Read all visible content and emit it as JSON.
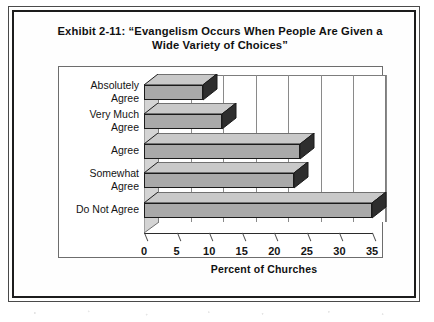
{
  "chart_data": {
    "type": "bar",
    "orientation": "horizontal",
    "title_line1": "Exhibit 2-11: “Evangelism Occurs When People Are Given a",
    "title_line2": "Wide Variety of Choices”",
    "categories": [
      "Absolutely Agree",
      "Very Much Agree",
      "Agree",
      "Somewhat Agree",
      "Do Not Agree"
    ],
    "category_lines": [
      [
        "Absolutely",
        "Agree"
      ],
      [
        "Very Much",
        "Agree"
      ],
      [
        "Agree"
      ],
      [
        "Somewhat",
        "Agree"
      ],
      [
        "Do Not Agree"
      ]
    ],
    "values": [
      9,
      12,
      24,
      23,
      35
    ],
    "xlabel": "Percent of Churches",
    "ylabel": "",
    "xlim": [
      0,
      35
    ],
    "xticks": [
      0,
      5,
      10,
      15,
      20,
      25,
      30,
      35
    ],
    "xtick_labels": [
      "0",
      "5",
      "10",
      "15",
      "20",
      "25",
      "30",
      "35"
    ],
    "grid": "vertical",
    "legend": "none",
    "style_3d": true,
    "bar_fill_color": "#a9a9a9",
    "bar_edge_color": "#1b1b1b",
    "bar_top_color": "#c9c9c9",
    "bar_side_color": "#2e2e2e",
    "plot_background": "#ffffff",
    "text_color": "#141414"
  }
}
